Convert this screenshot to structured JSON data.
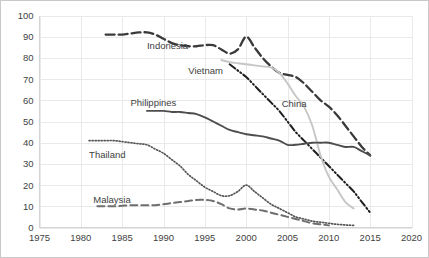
{
  "chart_data": {
    "type": "line",
    "title": "",
    "subtitle": "",
    "xlabel": "",
    "ylabel": "",
    "xlim": [
      1975,
      2020
    ],
    "ylim": [
      0,
      100
    ],
    "grid": true,
    "legend_position": "inline-labels",
    "xticks": [
      "1975",
      "1980",
      "1985",
      "1990",
      "1995",
      "2000",
      "2005",
      "2010",
      "2015",
      "2020"
    ],
    "yticks": [
      "0",
      "10",
      "20",
      "30",
      "40",
      "50",
      "60",
      "70",
      "80",
      "90",
      "100"
    ],
    "series": [
      {
        "name": "Indonesia",
        "style": "long-dash",
        "color": "#3a3a3a",
        "label_x": 1988.0,
        "label_y": 84.0,
        "x": [
          1983,
          1984,
          1985,
          1986,
          1987,
          1988,
          1989,
          1990,
          1991,
          1992,
          1993,
          1994,
          1995,
          1996,
          1997,
          1998,
          1999,
          2000,
          2001,
          2002,
          2003,
          2004,
          2005,
          2006,
          2007,
          2008,
          2009,
          2010,
          2011,
          2012,
          2013,
          2014,
          2015
        ],
        "y": [
          91,
          91,
          91,
          91.5,
          92,
          92,
          91,
          89,
          87,
          86,
          85.5,
          85.5,
          86,
          86,
          84,
          82,
          84,
          90,
          85,
          80,
          76,
          73,
          72,
          71,
          68,
          64,
          60,
          57,
          53,
          48,
          43,
          38,
          34
        ]
      },
      {
        "name": "Vietnam",
        "style": "dash-dot-dot",
        "color": "#1f1f1f",
        "label_x": 1993.0,
        "label_y": 72.5,
        "x": [
          1998,
          1999,
          2000,
          2001,
          2002,
          2003,
          2004,
          2005,
          2006,
          2007,
          2008,
          2009,
          2010,
          2011,
          2012,
          2013,
          2014,
          2015
        ],
        "y": [
          77,
          74,
          71,
          67,
          63,
          59,
          55,
          50,
          45,
          41,
          37,
          33,
          29,
          25,
          21,
          17,
          12,
          7
        ]
      },
      {
        "name": "China",
        "style": "solid",
        "color": "#c6c6c6",
        "label_x": 2004.3,
        "label_y": 57.0,
        "x": [
          1997,
          1998,
          1999,
          2000,
          2001,
          2002,
          2003,
          2004,
          2005,
          2006,
          2007,
          2008,
          2009,
          2010,
          2011,
          2012,
          2013
        ],
        "y": [
          79,
          78,
          77.5,
          77,
          76.5,
          76,
          75.5,
          73,
          68,
          62,
          57,
          48,
          34,
          24,
          18,
          12,
          9
        ]
      },
      {
        "name": "Philippines",
        "style": "solid",
        "color": "#4d4d4d",
        "label_x": 1986.0,
        "label_y": 57.5,
        "x": [
          1988,
          1989,
          1990,
          1991,
          1992,
          1993,
          1994,
          1995,
          1996,
          1997,
          1998,
          1999,
          2000,
          2001,
          2002,
          2003,
          2004,
          2005,
          2006,
          2007,
          2008,
          2009,
          2010,
          2011,
          2012,
          2013,
          2014,
          2015
        ],
        "y": [
          55,
          55,
          55,
          54.5,
          54.5,
          54,
          53.5,
          52,
          50,
          48,
          46,
          45,
          44,
          43.5,
          43,
          42,
          41,
          39,
          39,
          39.5,
          40,
          40,
          40,
          39,
          38,
          38,
          36,
          34
        ]
      },
      {
        "name": "Thailand",
        "style": "dotted",
        "color": "#555555",
        "label_x": 1981.0,
        "label_y": 33.0,
        "x": [
          1981,
          1982,
          1983,
          1984,
          1985,
          1986,
          1987,
          1988,
          1989,
          1990,
          1991,
          1992,
          1993,
          1994,
          1995,
          1996,
          1997,
          1998,
          1999,
          2000,
          2001,
          2002,
          2003,
          2004,
          2005,
          2006,
          2007,
          2008,
          2009,
          2010,
          2011,
          2012,
          2013
        ],
        "y": [
          41,
          41,
          41,
          41,
          40.5,
          40,
          39.5,
          39,
          37,
          35,
          32,
          29,
          25,
          22,
          19,
          17,
          15,
          15,
          17,
          20,
          17,
          14,
          11,
          9,
          7,
          5,
          4,
          3,
          2.5,
          2,
          1.5,
          1.2,
          1
        ]
      },
      {
        "name": "Malaysia",
        "style": "dash",
        "color": "#6e6e6e",
        "label_x": 1981.5,
        "label_y": 11.5,
        "x": [
          1982,
          1983,
          1984,
          1985,
          1986,
          1987,
          1988,
          1989,
          1990,
          1991,
          1992,
          1993,
          1994,
          1995,
          1996,
          1997,
          1998,
          1999,
          2000,
          2001,
          2002,
          2003,
          2004,
          2005,
          2006,
          2007,
          2008,
          2009,
          2010
        ],
        "y": [
          10,
          10,
          10,
          10.3,
          10.5,
          10.5,
          10.5,
          10.5,
          11,
          11.5,
          12,
          12.5,
          13,
          13,
          12.5,
          11,
          9,
          8.5,
          9,
          8.5,
          8,
          7,
          6,
          5,
          4,
          3,
          2,
          1.5,
          1
        ]
      }
    ]
  }
}
